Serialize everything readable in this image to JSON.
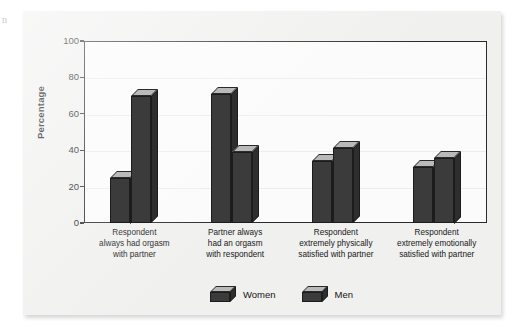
{
  "figure": {
    "edge_artifact": "n",
    "background_color": "#f0f0ef",
    "plot_background_color": "#fbfbfb",
    "frame_color": "#2a2a2a"
  },
  "chart_data": {
    "type": "bar",
    "title": "",
    "subtitle": "",
    "xlabel": "",
    "ylabel": "Percentage",
    "ylim": [
      0,
      100
    ],
    "yticks": [
      0,
      20,
      40,
      60,
      80,
      100
    ],
    "ytick_labels": [
      "0",
      "20",
      "40",
      "60",
      "80",
      "100"
    ],
    "grid": false,
    "legend_position": "bottom-center",
    "bar_style": "3d",
    "bar_front_color": "#3b3b3b",
    "bar_top_color": "#b9b9b9",
    "bar_side_color": "#2e2e2e",
    "categories": [
      "Respondent always had orgasm with partner",
      "Partner always had an orgasm with respondent",
      "Respondent extremely physically satisfied with partner",
      "Respondent extremely emotionally satisfied with partner"
    ],
    "category_lines": [
      [
        "Respondent",
        "always had orgasm",
        "with partner"
      ],
      [
        "Partner always",
        "had an orgasm",
        "with respondent"
      ],
      [
        "Respondent",
        "extremely physically",
        "satisfied with partner"
      ],
      [
        "Respondent",
        "extremely emotionally",
        "satisfied with partner"
      ]
    ],
    "series": [
      {
        "name": "Women",
        "values": [
          25,
          71,
          34,
          31
        ]
      },
      {
        "name": "Men",
        "values": [
          70,
          39,
          41,
          36
        ]
      }
    ]
  },
  "legend": {
    "items": [
      {
        "label": "Women"
      },
      {
        "label": "Men"
      }
    ]
  }
}
